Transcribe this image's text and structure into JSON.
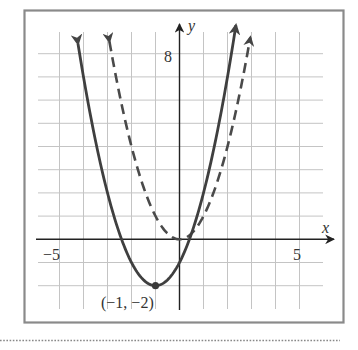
{
  "chart_data": {
    "type": "line",
    "title": "",
    "xlabel": "x",
    "ylabel": "y",
    "xlim": [
      -5.6,
      6.2
    ],
    "ylim": [
      -3,
      9.3
    ],
    "grid": true,
    "x_tick_labels": [
      {
        "value": -5,
        "label": "−5"
      },
      {
        "value": 5,
        "label": "5"
      }
    ],
    "y_tick_labels": [
      {
        "value": 8,
        "label": "8"
      }
    ],
    "series": [
      {
        "name": "solid parabola",
        "equation": "y = (x + 1)^2 - 2",
        "style": "solid",
        "color": "#3f3f3f",
        "vertex": [
          -1,
          -2
        ],
        "x_range": [
          -4.23,
          2.35
        ],
        "points": [
          [
            -4,
            7
          ],
          [
            -3,
            2
          ],
          [
            -2,
            -1
          ],
          [
            -1,
            -2
          ],
          [
            0,
            -1
          ],
          [
            1,
            2
          ],
          [
            2,
            7
          ]
        ]
      },
      {
        "name": "dashed parabola",
        "equation": "y = x^2",
        "style": "dashed",
        "color": "#4a4a4a",
        "vertex": [
          0,
          0
        ],
        "x_range": [
          -2.92,
          2.95
        ],
        "points": [
          [
            -3,
            9
          ],
          [
            -2,
            4
          ],
          [
            -1,
            1
          ],
          [
            0,
            0
          ],
          [
            1,
            1
          ],
          [
            2,
            4
          ],
          [
            3,
            9
          ]
        ]
      }
    ],
    "annotations": [
      {
        "text": "(−1, −2)",
        "point": [
          -1,
          -2
        ]
      }
    ]
  },
  "labels": {
    "x_axis": "x",
    "y_axis": "y",
    "x_neg": "−5",
    "x_pos": "5",
    "y_top": "8",
    "vertex": "(−1, −2)"
  },
  "colors": {
    "curve": "#3f3f3f",
    "grid": "#c4c4c4",
    "axis": "#222222",
    "frame": "#8a8a8a"
  }
}
